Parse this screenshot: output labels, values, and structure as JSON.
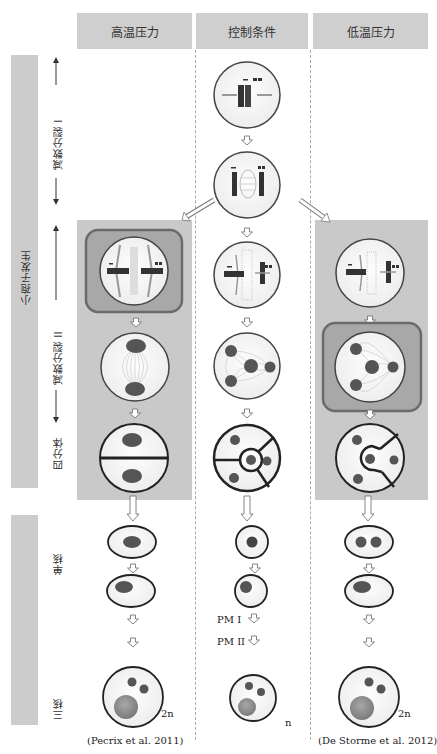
{
  "columns": [
    {
      "label": "高温压力",
      "citation": "(Pecrix et al. 2011)",
      "final_ploidy": "2n"
    },
    {
      "label": "控制条件",
      "citation": "",
      "final_ploidy": "n"
    },
    {
      "label": "低温压力",
      "citation": "(De Storme et al. 2012)",
      "final_ploidy": "2n"
    }
  ],
  "left_axis": {
    "group_label": "小孢子发生",
    "stages": [
      {
        "label": "减数分裂 I"
      },
      {
        "label": "减数分裂 II"
      },
      {
        "label": "四分体"
      },
      {
        "label": "单核"
      },
      {
        "label": "三核"
      }
    ]
  },
  "control_column_labels": {
    "pm1": "PM I",
    "pm2": "PM II"
  },
  "colors": {
    "header_bg": "#cfcfcf",
    "panel_bg": "#c9c9c9",
    "highlight_box": "#a8a8a8",
    "highlight_border": "#6b6b6b",
    "nucleus": "#555555",
    "vegetative_nucleus": "#8a8a8a",
    "cell_fill": "#f4f4f4"
  }
}
